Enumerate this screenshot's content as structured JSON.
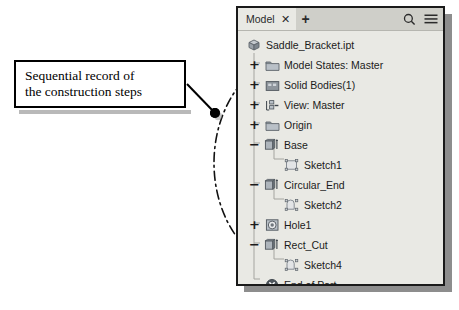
{
  "callout": {
    "text": "Sequential record of\nthe construction steps",
    "marker": "leader-dot"
  },
  "panel": {
    "tabs": [
      {
        "label": "Model",
        "close_label": "✕",
        "active": true
      }
    ],
    "add_tab_label": "+",
    "tools": [
      {
        "name": "search-icon",
        "label": "Q"
      },
      {
        "name": "menu-icon",
        "label": "≡"
      }
    ]
  },
  "tree": {
    "nodes": [
      {
        "label": "Saddle_Bracket.ipt",
        "toggle": "",
        "icon": "part-cube-icon",
        "indent": 0,
        "level": 0
      },
      {
        "label": "Model States: Master",
        "toggle": "+",
        "icon": "folder-icon",
        "indent": 1,
        "level": 1
      },
      {
        "label": "Solid Bodies(1)",
        "toggle": "+",
        "icon": "solid-body-icon",
        "indent": 1,
        "level": 1
      },
      {
        "label": "View: Master",
        "toggle": "+",
        "icon": "view-icon",
        "indent": 1,
        "level": 1
      },
      {
        "label": "Origin",
        "toggle": "+",
        "icon": "folder-icon",
        "indent": 1,
        "level": 1
      },
      {
        "label": "Base",
        "toggle": "−",
        "icon": "extrude-icon",
        "indent": 1,
        "level": 1
      },
      {
        "label": "Sketch1",
        "toggle": "",
        "icon": "sketch-rect-icon",
        "indent": 2,
        "level": 2
      },
      {
        "label": "Circular_End",
        "toggle": "−",
        "icon": "extrude-icon",
        "indent": 1,
        "level": 1
      },
      {
        "label": "Sketch2",
        "toggle": "",
        "icon": "sketch-arc-icon",
        "indent": 2,
        "level": 2
      },
      {
        "label": "Hole1",
        "toggle": "+",
        "icon": "hole-icon",
        "indent": 1,
        "level": 1
      },
      {
        "label": "Rect_Cut",
        "toggle": "−",
        "icon": "extrude-icon",
        "indent": 1,
        "level": 1
      },
      {
        "label": "Sketch4",
        "toggle": "",
        "icon": "sketch-arc-icon",
        "indent": 2,
        "level": 2
      },
      {
        "label": "End of Part",
        "toggle": "",
        "icon": "end-of-part-icon",
        "indent": 1,
        "level": 1
      }
    ]
  },
  "colors": {
    "panel_bg": "#e9e9e4",
    "tab_bg": "#cfcfc9",
    "border": "#1a1a1a",
    "shadow": "#8d8d8d",
    "text": "#1b1b1b",
    "icon_fill": "#a8aeb4",
    "icon_stroke": "#5d646b"
  }
}
